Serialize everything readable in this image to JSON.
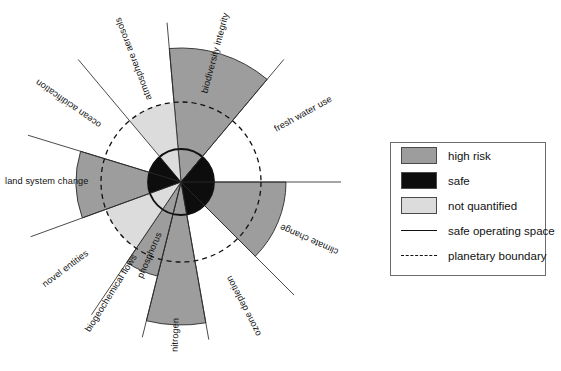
{
  "figure": {
    "type": "planetary-boundaries-radial-diagram",
    "center": {
      "x": 181,
      "y": 182
    },
    "safe_operating_space_radius": 33,
    "planetary_boundary_radius": 80,
    "divider_line_radius": 160,
    "colors": {
      "high_risk": "#9d9d9d",
      "safe": "#0d0d0d",
      "not_quantified": "#dcdcdc",
      "outline": "#2b2b2b",
      "boundary_circle": "#111111",
      "background": "#ffffff"
    }
  },
  "chart_data": {
    "type": "pie",
    "title": "",
    "legend_position": "right",
    "categories": [
      "biodiversity integrity",
      "fresh water use",
      "climate change",
      "ozone depletion",
      "nitrogen",
      "phosphorus",
      "novel entities",
      "land system change",
      "ocean acidification",
      "atmosphere aerosols"
    ],
    "series": [
      {
        "name": "sector radius (relative to planetary boundary = 80)",
        "values": [
          134,
          33,
          105,
          33,
          143,
          97,
          80,
          105,
          33,
          80
        ]
      },
      {
        "name": "safe core radius",
        "values": [
          33,
          33,
          33,
          0,
          33,
          0,
          0,
          33,
          33,
          0
        ]
      }
    ],
    "sectors": [
      {
        "label": "biodiversity integrity",
        "start_angle_deg": 265,
        "end_angle_deg": 310,
        "outer_radius": 134,
        "status": "high risk",
        "fill": "#9d9d9d",
        "safe_core": false,
        "label_rotation_deg": -52,
        "label_flip": false
      },
      {
        "label": "fresh water use",
        "start_angle_deg": 310,
        "end_angle_deg": 360,
        "outer_radius": 33,
        "status": "safe",
        "fill": "#0d0d0d",
        "safe_core": true,
        "label_rotation_deg": -15,
        "label_flip": false
      },
      {
        "label": "climate change",
        "start_angle_deg": 0,
        "end_angle_deg": 45,
        "outer_radius": 105,
        "status": "high risk",
        "fill": "#9d9d9d",
        "safe_core": true,
        "label_rotation_deg": 22,
        "label_flip": true
      },
      {
        "label": "ozone depletion",
        "start_angle_deg": 45,
        "end_angle_deg": 80,
        "outer_radius": 33,
        "status": "safe",
        "fill": "#0d0d0d",
        "safe_core": true,
        "label_rotation_deg": 62,
        "label_flip": true
      },
      {
        "label": "nitrogen",
        "start_angle_deg": 80,
        "end_angle_deg": 104,
        "outer_radius": 143,
        "status": "high risk",
        "fill": "#9d9d9d",
        "safe_core": false,
        "label_rotation_deg": 92,
        "label_flip": true
      },
      {
        "label": "phosphorus",
        "start_angle_deg": 104,
        "end_angle_deg": 124,
        "outer_radius": 97,
        "status": "high risk",
        "fill": "#9d9d9d",
        "safe_core": false,
        "label_rotation_deg": 114,
        "label_flip": true
      },
      {
        "label": "biogeochemical flows",
        "start_angle_deg": 80,
        "end_angle_deg": 124,
        "outer_radius": 0,
        "status": "group",
        "fill": "none",
        "safe_core": false,
        "label_rotation_deg": 124,
        "label_flip": true
      },
      {
        "label": "novel entities",
        "start_angle_deg": 124,
        "end_angle_deg": 160,
        "outer_radius": 80,
        "status": "not quantified",
        "fill": "#dcdcdc",
        "safe_core": false,
        "label_rotation_deg": 142,
        "label_flip": true
      },
      {
        "label": "land system change",
        "start_angle_deg": 160,
        "end_angle_deg": 197,
        "outer_radius": 105,
        "status": "high risk",
        "fill": "#9d9d9d",
        "safe_core": true,
        "label_rotation_deg": 178,
        "label_flip": true
      },
      {
        "label": "ocean acidification",
        "start_angle_deg": 197,
        "end_angle_deg": 230,
        "outer_radius": 33,
        "status": "safe",
        "fill": "#0d0d0d",
        "safe_core": true,
        "label_rotation_deg": -145,
        "label_flip": false
      },
      {
        "label": "atmosphere aerosols",
        "start_angle_deg": 230,
        "end_angle_deg": 265,
        "outer_radius": 80,
        "status": "not quantified",
        "fill": "#dcdcdc",
        "safe_core": false,
        "label_rotation_deg": -111,
        "label_flip": false
      }
    ]
  },
  "legend": {
    "items": [
      {
        "label": "high risk",
        "swatch": "fill",
        "color": "#9d9d9d"
      },
      {
        "label": "safe",
        "swatch": "fill",
        "color": "#0d0d0d"
      },
      {
        "label": "not quantified",
        "swatch": "fill",
        "color": "#dcdcdc"
      },
      {
        "label": "safe operating space",
        "swatch": "solid-line",
        "color": "#111111"
      },
      {
        "label": "planetary boundary",
        "swatch": "dashed-line",
        "color": "#111111"
      }
    ]
  },
  "labels": {
    "biodiversity_integrity": "biodiversity integrity",
    "fresh_water_use": "fresh water use",
    "climate_change": "climate change",
    "ozone_depletion": "ozone depletion",
    "nitrogen": "nitrogen",
    "phosphorus": "phosphorus",
    "biogeochemical_flows": "biogeochemical flows",
    "novel_entities": "novel entities",
    "land_system_change": "land system change",
    "ocean_acidification": "ocean acidification",
    "atmosphere_aerosols": "atmosphere aerosols"
  }
}
